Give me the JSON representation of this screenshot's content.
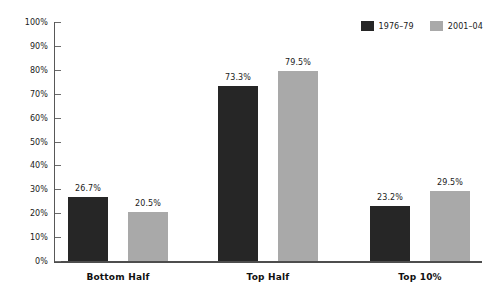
{
  "chart_data": {
    "type": "bar",
    "title": "",
    "subtitle": "",
    "xlabel": "",
    "ylabel": "",
    "categories": [
      "Bottom Half",
      "Top Half",
      "Top 10%"
    ],
    "series": [
      {
        "name": "1976–79",
        "color": "#262626",
        "values": [
          26.7,
          73.3,
          23.2
        ],
        "labels": [
          "26.7%",
          "73.3%",
          "23.2%"
        ]
      },
      {
        "name": "2001–04",
        "color": "#a9a9a9",
        "values": [
          20.5,
          79.5,
          29.5
        ],
        "labels": [
          "20.5%",
          "79.5%",
          "29.5%"
        ]
      }
    ],
    "ylim": [
      0,
      100
    ],
    "ytick_values": [
      0,
      10,
      20,
      30,
      40,
      50,
      60,
      70,
      80,
      90,
      100
    ],
    "ytick_labels": [
      "0%",
      "10%",
      "20%",
      "30%",
      "40%",
      "50%",
      "60%",
      "70%",
      "80%",
      "90%",
      "100%"
    ],
    "grid": false,
    "legend_position": "top-right",
    "annotations": []
  },
  "legend": {
    "entries": [
      {
        "label": "1976–79",
        "color": "#262626"
      },
      {
        "label": "2001–04",
        "color": "#a9a9a9"
      }
    ]
  },
  "axes": {
    "y_axis_color": "#585858",
    "x_axis_color": "#4d4d4d"
  }
}
